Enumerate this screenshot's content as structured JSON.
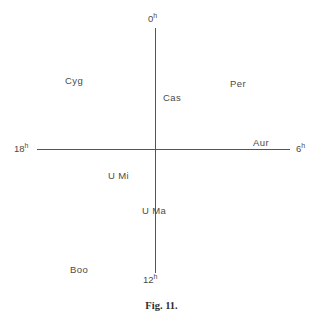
{
  "figure": {
    "caption": "Fig. 11.",
    "background_color": "#ffffff",
    "line_color": "#555555",
    "text_color": "#4a4a4a"
  },
  "axes": {
    "hour_labels": [
      {
        "id": "hour-0",
        "number": "0",
        "unit": "h",
        "position": "top"
      },
      {
        "id": "hour-6",
        "number": "6",
        "unit": "h",
        "position": "right"
      },
      {
        "id": "hour-12",
        "number": "12",
        "unit": "h",
        "position": "bottom"
      },
      {
        "id": "hour-18",
        "number": "18",
        "unit": "h",
        "position": "left"
      }
    ]
  },
  "constellations": [
    {
      "id": "cyg",
      "label": "Cyg"
    },
    {
      "id": "cas",
      "label": "Cas"
    },
    {
      "id": "per",
      "label": "Per"
    },
    {
      "id": "aur",
      "label": "Aur"
    },
    {
      "id": "umi",
      "label": "U Mi"
    },
    {
      "id": "uma",
      "label": "U Ma"
    },
    {
      "id": "boo",
      "label": "Boo"
    }
  ]
}
